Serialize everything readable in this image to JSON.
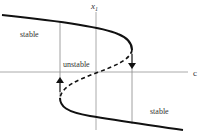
{
  "diagram": {
    "type": "bifurcation-hysteresis",
    "axes": {
      "vertical_label": "x",
      "vertical_label_subscript": "1",
      "horizontal_label": "c"
    },
    "regions": {
      "upper_branch_label": "stable",
      "middle_branch_label": "unstable",
      "lower_branch_label": "stable"
    },
    "transitions": [
      {
        "name": "jump-up",
        "direction": "up",
        "at": "left fold"
      },
      {
        "name": "jump-down",
        "direction": "down",
        "at": "right fold"
      }
    ],
    "colors": {
      "curve": "#111111",
      "axis": "#aaaaaa",
      "guide": "#888888",
      "text": "#333333"
    }
  }
}
